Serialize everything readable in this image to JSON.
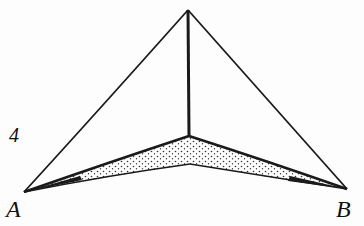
{
  "figure": {
    "number": "4",
    "vertices": {
      "a": "A",
      "b": "B"
    },
    "colors": {
      "ink": "#1a1a1a",
      "background": "#fdfdfd"
    }
  }
}
